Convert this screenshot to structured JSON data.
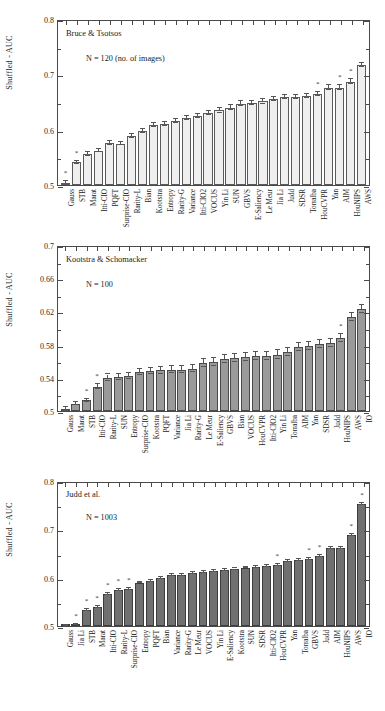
{
  "figure": {
    "background": "#ffffff",
    "width": 385,
    "height": 711,
    "ylabel": "Shuffled - AUC"
  },
  "chart_data": [
    {
      "type": "bar",
      "title": "Bruce & Tsotsos",
      "annotation": "N = 120 (no. of images)",
      "xlabel": "",
      "ylabel": "Shuffled - AUC",
      "ylim": [
        0.5,
        0.8
      ],
      "yticks": [
        0.5,
        0.6,
        0.7,
        0.8
      ],
      "ytick_labels": [
        "0.5",
        "0.6",
        "0.7",
        "0.8"
      ],
      "grid": false,
      "bar_fill": "#efefef",
      "bar_edge": "#5a5a5a",
      "categories": [
        "Gauss",
        "STB",
        "Marat",
        "Itti-CIO",
        "PQFT",
        "Surprise-CIO",
        "Rarity-L",
        "Bian",
        "Kootstra",
        "Entropy",
        "Rarity-G",
        "Variance",
        "Itti-CIO2",
        "VOCUS",
        "Yin Li",
        "SUN",
        "GBVS",
        "E-Saliency",
        "Le Meur",
        "Jia Li",
        "Judd",
        "SDSR",
        "Torralba",
        "HouCVPR",
        "Yan",
        "AIM",
        "HouNIPS",
        "AWS"
      ],
      "values": [
        0.503,
        0.541,
        0.556,
        0.562,
        0.576,
        0.575,
        0.589,
        0.598,
        0.608,
        0.61,
        0.616,
        0.621,
        0.625,
        0.63,
        0.635,
        0.64,
        0.647,
        0.648,
        0.651,
        0.655,
        0.659,
        0.659,
        0.661,
        0.665,
        0.676,
        0.676,
        0.687,
        0.717
      ],
      "errors": [
        0.004,
        0.003,
        0.003,
        0.003,
        0.003,
        0.003,
        0.004,
        0.004,
        0.004,
        0.004,
        0.004,
        0.004,
        0.004,
        0.004,
        0.004,
        0.004,
        0.004,
        0.004,
        0.004,
        0.004,
        0.004,
        0.004,
        0.004,
        0.004,
        0.004,
        0.004,
        0.004,
        0.004
      ],
      "significance_markers": [
        "Gauss",
        "STB",
        "HouCVPR",
        "AIM",
        "HouNIPS"
      ],
      "marker_glyph": "*"
    },
    {
      "type": "bar",
      "title": "Kootstra & Schomacker",
      "annotation": "N = 100",
      "xlabel": "",
      "ylabel": "Shuffled - AUC",
      "ylim": [
        0.5,
        0.7
      ],
      "yticks": [
        0.5,
        0.54,
        0.58,
        0.62,
        0.66,
        0.7
      ],
      "ytick_labels": [
        "0.5",
        "0.54",
        "0.58",
        "0.62",
        "0.66",
        "0.7"
      ],
      "grid": false,
      "bar_fill": "#9a9a9a",
      "bar_edge": "#4a4a4a",
      "categories": [
        "Gauss",
        "Marat",
        "STB",
        "Itti-CIO",
        "Rarity-L",
        "SUN",
        "Entropy",
        "Surprise-CIO",
        "Kootstra",
        "PQFT",
        "Variance",
        "Jia Li",
        "Rarity-G",
        "Le Meur",
        "E-Saliency",
        "GBVS",
        "Bian",
        "VOCUS",
        "HouCVPR",
        "Itti-CIO2",
        "Yin Li",
        "Torralba",
        "AIM",
        "Yan",
        "SDSR",
        "Judd",
        "HouNIPS",
        "AWS",
        "IO"
      ],
      "values": [
        0.501,
        0.509,
        0.513,
        0.529,
        0.54,
        0.541,
        0.542,
        0.547,
        0.548,
        0.549,
        0.55,
        0.55,
        0.551,
        0.558,
        0.559,
        0.563,
        0.564,
        0.565,
        0.566,
        0.566,
        0.568,
        0.571,
        0.577,
        0.578,
        0.581,
        0.582,
        0.588,
        0.613,
        0.623
      ],
      "errors": [
        0.004,
        0.002,
        0.002,
        0.003,
        0.004,
        0.004,
        0.004,
        0.004,
        0.004,
        0.004,
        0.004,
        0.004,
        0.004,
        0.005,
        0.005,
        0.005,
        0.005,
        0.005,
        0.005,
        0.005,
        0.005,
        0.005,
        0.005,
        0.005,
        0.005,
        0.005,
        0.005,
        0.005,
        0.005
      ],
      "significance_markers": [
        "STB",
        "Itti-CIO",
        "HouNIPS"
      ],
      "marker_glyph": "*"
    },
    {
      "type": "bar",
      "title": "Judd et al.",
      "annotation": "N = 1003",
      "xlabel": "",
      "ylabel": "Shuffled - AUC",
      "ylim": [
        0.5,
        0.8
      ],
      "yticks": [
        0.5,
        0.6,
        0.7,
        0.8
      ],
      "ytick_labels": [
        "0.5",
        "0.6",
        "0.7",
        "0.8"
      ],
      "grid": false,
      "bar_fill": "#707070",
      "bar_edge": "#3d3d3d",
      "categories": [
        "Gauss",
        "Jia Li",
        "STB",
        "Marat",
        "Itti-CIO",
        "Rarity-L",
        "Surprise-CIO",
        "Entropy",
        "PQFT",
        "Bian",
        "Variance",
        "Rarity-G",
        "Le Meur",
        "VOCUS",
        "Yin Li",
        "E-Saliency",
        "Kootstra",
        "SUN",
        "SDSR",
        "Itti-CIO2",
        "HouCVPR",
        "Yan",
        "Torralba",
        "GBVS",
        "Judd",
        "AIM",
        "HouNIPS",
        "AWS",
        "IO"
      ],
      "values": [
        0.501,
        0.503,
        0.533,
        0.539,
        0.566,
        0.574,
        0.577,
        0.59,
        0.593,
        0.6,
        0.605,
        0.606,
        0.61,
        0.611,
        0.613,
        0.615,
        0.617,
        0.621,
        0.623,
        0.624,
        0.626,
        0.634,
        0.636,
        0.638,
        0.645,
        0.661,
        0.662,
        0.688,
        0.753
      ],
      "errors": [
        0.001,
        0.001,
        0.002,
        0.002,
        0.002,
        0.002,
        0.002,
        0.002,
        0.002,
        0.002,
        0.002,
        0.002,
        0.002,
        0.002,
        0.002,
        0.002,
        0.002,
        0.002,
        0.002,
        0.002,
        0.002,
        0.002,
        0.002,
        0.002,
        0.002,
        0.002,
        0.002,
        0.002,
        0.002
      ],
      "significance_markers": [
        "Jia Li",
        "STB",
        "Marat",
        "Itti-CIO",
        "Rarity-L",
        "Surprise-CIO",
        "HouCVPR",
        "GBVS",
        "Judd",
        "AWS",
        "IO"
      ],
      "marker_glyph": "*"
    }
  ]
}
